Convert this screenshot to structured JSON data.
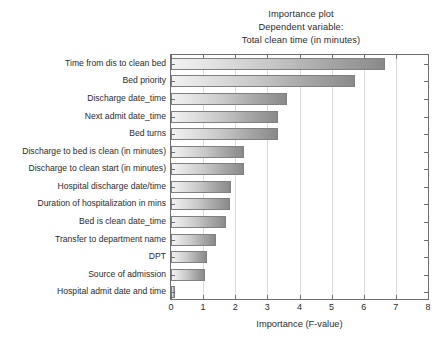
{
  "chart_data": {
    "type": "bar",
    "orientation": "horizontal",
    "title": "Importance plot",
    "subtitle": "Dependent variable:",
    "subtitle2": "Total clean time (in minutes)",
    "xlabel": "Importance (F-value)",
    "ylabel": "",
    "xlim": [
      0,
      8
    ],
    "xticks": [
      0,
      1,
      2,
      3,
      4,
      5,
      6,
      7,
      8
    ],
    "xtick_labels": [
      "0",
      "1",
      "2",
      "3",
      "4",
      "5",
      "6",
      "7",
      "8"
    ],
    "grid": true,
    "legend": false,
    "bar_fill": "gradient-light-to-dark-gray",
    "bar_edge_color": "#808080",
    "categories": [
      "Time from dis to clean bed",
      "Bed priority",
      "Discharge date_time",
      "Next admit date_time",
      "Bed turns",
      "Discharge to bed is clean (in minutes)",
      "Discharge to clean start (in minutes)",
      "Hospital discharge date/time",
      "Duration of hospitalization in mins",
      "Bed is clean date_time",
      "Transfer to department name",
      "DPT",
      "Source of admission",
      "Hospital admit date and time"
    ],
    "values": [
      6.65,
      5.74,
      3.6,
      3.32,
      3.32,
      2.26,
      2.26,
      1.86,
      1.83,
      1.7,
      1.4,
      1.12,
      1.05,
      0.12
    ]
  },
  "axis": {
    "x_title": "Importance (F-value)"
  }
}
